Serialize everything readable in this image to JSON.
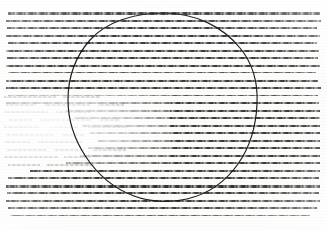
{
  "document": {
    "kind": "degraded-document-scan",
    "description": "Low-resolution photocopy of a printed text page; glyph rows are smeared into horizontal strokes and are illegible.",
    "legibility": "illegible",
    "page_width": 327,
    "page_height": 230,
    "background_color": "#fbfbfa",
    "ink_color": "#2d2b29"
  },
  "annotation": {
    "shape": "circle",
    "label": "hand-drawn circle overlay",
    "stroke_color": "#1b1a19",
    "center_x": 162,
    "center_y": 106,
    "radius_x": 94,
    "radius_y": 93
  },
  "layout": {
    "margin_left": 6,
    "margin_right": 8,
    "margin_top": 12,
    "line_pitch": 7.6,
    "line_count": 27,
    "washout_region": {
      "label": "bleached lower-left region",
      "x": 0,
      "y": 92,
      "width": 170,
      "height": 78
    }
  },
  "text_lines": [
    {
      "y": 12,
      "x": 8,
      "w": 312,
      "weight": "heavy",
      "text": ""
    },
    {
      "y": 19.5,
      "x": 6,
      "w": 315,
      "weight": "normal",
      "text": ""
    },
    {
      "y": 27,
      "x": 7,
      "w": 310,
      "weight": "normal",
      "text": ""
    },
    {
      "y": 34.5,
      "x": 6,
      "w": 314,
      "weight": "normal",
      "text": ""
    },
    {
      "y": 42,
      "x": 8,
      "w": 309,
      "weight": "normal",
      "text": ""
    },
    {
      "y": 49.5,
      "x": 6,
      "w": 313,
      "weight": "normal",
      "text": ""
    },
    {
      "y": 57,
      "x": 7,
      "w": 311,
      "weight": "normal",
      "text": ""
    },
    {
      "y": 64.5,
      "x": 6,
      "w": 314,
      "weight": "normal",
      "text": ""
    },
    {
      "y": 72,
      "x": 8,
      "w": 308,
      "weight": "thin",
      "text": ""
    },
    {
      "y": 79.5,
      "x": 6,
      "w": 312,
      "weight": "normal",
      "text": ""
    },
    {
      "y": 87,
      "x": 6,
      "w": 315,
      "weight": "normal",
      "text": ""
    },
    {
      "y": 94.5,
      "x": 8,
      "w": 310,
      "weight": "thin",
      "text": ""
    },
    {
      "y": 102,
      "x": 6,
      "w": 313,
      "weight": "normal",
      "text": ""
    },
    {
      "y": 109.5,
      "x": 66,
      "w": 254,
      "weight": "normal",
      "text": ""
    },
    {
      "y": 117,
      "x": 74,
      "w": 246,
      "weight": "normal",
      "text": ""
    },
    {
      "y": 124.5,
      "x": 82,
      "w": 238,
      "weight": "normal",
      "text": ""
    },
    {
      "y": 132,
      "x": 90,
      "w": 230,
      "weight": "normal",
      "text": ""
    },
    {
      "y": 139.5,
      "x": 98,
      "w": 222,
      "weight": "normal",
      "text": ""
    },
    {
      "y": 147,
      "x": 88,
      "w": 232,
      "weight": "normal",
      "text": ""
    },
    {
      "y": 154.5,
      "x": 80,
      "w": 240,
      "weight": "normal",
      "text": ""
    },
    {
      "y": 162,
      "x": 66,
      "w": 254,
      "weight": "normal",
      "text": ""
    },
    {
      "y": 169.5,
      "x": 30,
      "w": 290,
      "weight": "normal",
      "text": ""
    },
    {
      "y": 177,
      "x": 8,
      "w": 311,
      "weight": "normal",
      "text": ""
    },
    {
      "y": 184.5,
      "x": 6,
      "w": 314,
      "weight": "heavy",
      "text": ""
    },
    {
      "y": 192,
      "x": 7,
      "w": 312,
      "weight": "normal",
      "text": ""
    },
    {
      "y": 199.5,
      "x": 6,
      "w": 314,
      "weight": "normal",
      "text": ""
    },
    {
      "y": 207,
      "x": 8,
      "w": 309,
      "weight": "normal",
      "text": ""
    },
    {
      "y": 214.5,
      "x": 10,
      "w": 300,
      "weight": "thin",
      "text": ""
    }
  ],
  "faded_fragments": [
    {
      "y": 96,
      "x": 4,
      "w": 52
    },
    {
      "y": 96,
      "x": 62,
      "w": 38
    },
    {
      "y": 103.5,
      "x": 6,
      "w": 30
    },
    {
      "y": 103.5,
      "x": 44,
      "w": 46
    },
    {
      "y": 103.5,
      "x": 98,
      "w": 26
    },
    {
      "y": 111,
      "x": 4,
      "w": 44
    },
    {
      "y": 111,
      "x": 56,
      "w": 34
    },
    {
      "y": 118.5,
      "x": 8,
      "w": 24
    },
    {
      "y": 118.5,
      "x": 40,
      "w": 52
    },
    {
      "y": 118.5,
      "x": 100,
      "w": 20
    },
    {
      "y": 126,
      "x": 4,
      "w": 36
    },
    {
      "y": 126,
      "x": 50,
      "w": 28
    },
    {
      "y": 126,
      "x": 88,
      "w": 40
    },
    {
      "y": 133.5,
      "x": 6,
      "w": 48
    },
    {
      "y": 133.5,
      "x": 62,
      "w": 22
    },
    {
      "y": 141,
      "x": 4,
      "w": 26
    },
    {
      "y": 141,
      "x": 38,
      "w": 44
    },
    {
      "y": 148.5,
      "x": 6,
      "w": 40
    },
    {
      "y": 148.5,
      "x": 54,
      "w": 30
    },
    {
      "y": 148.5,
      "x": 92,
      "w": 34
    },
    {
      "y": 156,
      "x": 4,
      "w": 54
    },
    {
      "y": 156,
      "x": 64,
      "w": 26
    },
    {
      "y": 163.5,
      "x": 8,
      "w": 32
    },
    {
      "y": 163.5,
      "x": 46,
      "w": 48
    }
  ]
}
